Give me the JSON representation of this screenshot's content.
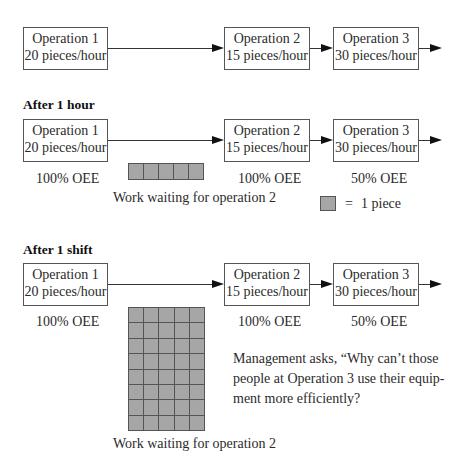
{
  "stages": [
    {
      "heading": "",
      "operations": [
        {
          "name": "Operation 1",
          "rate": "20 pieces/hour"
        },
        {
          "name": "Operation 2",
          "rate": "15 pieces/hour"
        },
        {
          "name": "Operation 3",
          "rate": "30 pieces/hour"
        }
      ]
    },
    {
      "heading": "After 1 hour",
      "operations": [
        {
          "name": "Operation 1",
          "rate": "20 pieces/hour",
          "oee": "100% OEE"
        },
        {
          "name": "Operation 2",
          "rate": "15 pieces/hour",
          "oee": "100% OEE"
        },
        {
          "name": "Operation 3",
          "rate": "30 pieces/hour",
          "oee": "50% OEE"
        }
      ],
      "queue": {
        "cols": 5,
        "rows": 1,
        "count": 5,
        "label": "Work waiting for operation 2"
      },
      "legend": {
        "symbol": "=",
        "label": "1 piece"
      }
    },
    {
      "heading": "After 1 shift",
      "operations": [
        {
          "name": "Operation 1",
          "rate": "20 pieces/hour",
          "oee": "100% OEE"
        },
        {
          "name": "Operation 2",
          "rate": "15 pieces/hour",
          "oee": "100% OEE"
        },
        {
          "name": "Operation 3",
          "rate": "30 pieces/hour",
          "oee": "50% OEE"
        }
      ],
      "queue": {
        "cols": 5,
        "rows": 8,
        "count": 40,
        "label": "Work waiting for operation 2"
      },
      "note": "Management asks, “Why can’t those people at Operation 3 use their equip-ment more efficiently?"
    }
  ],
  "note_lines": [
    "Management asks, “Why can’t those",
    "people at Operation 3 use their equip-",
    "ment more efficiently?"
  ],
  "colors": {
    "piece_fill": "#a6a6a6",
    "piece_border": "#555555",
    "box_border": "#555555",
    "arrow": "#111111"
  }
}
